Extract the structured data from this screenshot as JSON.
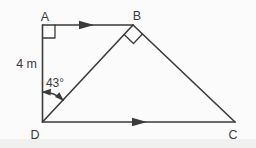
{
  "diagram": {
    "background_color": "#fbfbfb",
    "line_color": "#3b3b3b",
    "scan_band_color": "#f0f0ee",
    "vertices": {
      "A": "A",
      "B": "B",
      "C": "C",
      "D": "D"
    },
    "side_AD_label": "4 m",
    "angle_ADB_label": "43°"
  }
}
